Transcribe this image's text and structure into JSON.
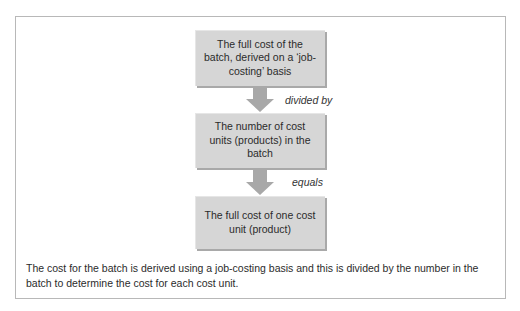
{
  "diagram": {
    "type": "flowchart",
    "boxes": [
      {
        "id": "batch-full-cost",
        "text": "The full cost of the batch, derived on a ‘job-costing’ basis"
      },
      {
        "id": "number-of-units",
        "text": "The number of cost units (products) in the batch"
      },
      {
        "id": "unit-full-cost",
        "text": "The full cost of one cost unit (product)"
      }
    ],
    "connectors": [
      {
        "from": "batch-full-cost",
        "to": "number-of-units",
        "label": "divided by"
      },
      {
        "from": "number-of-units",
        "to": "unit-full-cost",
        "label": "equals"
      }
    ],
    "caption": "The cost for the batch is derived using a job-costing basis and this is divided by the number in the batch to determine the cost for each cost unit."
  },
  "colors": {
    "box_fill": "#d6d6d6",
    "box_shadow": "#a9a9a9",
    "arrow_fill": "#a8a8a8",
    "frame_border": "#b8b8b8",
    "text": "#2b2b2b"
  }
}
